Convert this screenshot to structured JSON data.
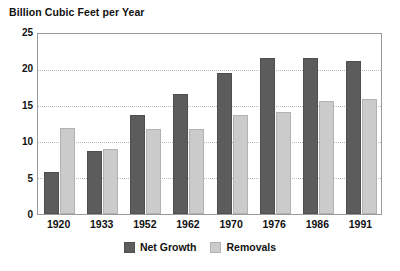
{
  "chart_data": {
    "type": "bar",
    "title": "Billion Cubic Feet per Year",
    "xlabel": "",
    "ylabel": "",
    "ylim": [
      0,
      25
    ],
    "yticks": [
      0,
      5,
      10,
      15,
      20,
      25
    ],
    "grid": true,
    "legend_position": "bottom-center",
    "categories": [
      "1920",
      "1933",
      "1952",
      "1962",
      "1970",
      "1976",
      "1986",
      "1991"
    ],
    "series": [
      {
        "name": "Net Growth",
        "color": "#5c5c5c",
        "values": [
          5.9,
          8.8,
          13.8,
          16.7,
          19.6,
          21.7,
          21.7,
          21.2
        ]
      },
      {
        "name": "Removals",
        "color": "#cbcbcb",
        "values": [
          11.9,
          9.0,
          11.8,
          11.8,
          13.8,
          14.1,
          15.7,
          16.0
        ]
      }
    ]
  },
  "legend": {
    "items": [
      {
        "label": "Net Growth",
        "swatch": "net"
      },
      {
        "label": "Removals",
        "swatch": "rem"
      }
    ]
  }
}
